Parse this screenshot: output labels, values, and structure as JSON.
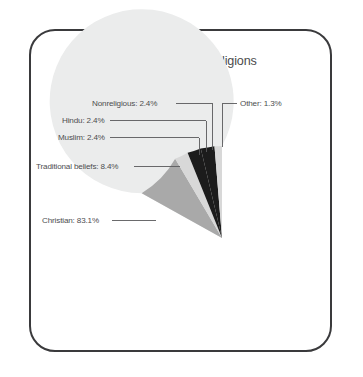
{
  "figure": {
    "title": "South Africa: major religions",
    "frame_color": "#3a3a3c",
    "background": "#ffffff",
    "label_color": "#4d4d4f"
  },
  "chart_data": {
    "type": "pie",
    "title": "South Africa: major religions",
    "xlabel": "",
    "ylabel": "",
    "legend_position": "none",
    "grid": false,
    "labels_on_slices": false,
    "start_angle_deg": 90,
    "direction": "counterclockwise",
    "categories": [
      "Christian",
      "Traditional beliefs",
      "Muslim",
      "Hindu",
      "Nonreligious",
      "Other"
    ],
    "values": [
      83.1,
      8.4,
      2.4,
      2.4,
      2.4,
      1.3
    ],
    "unit": "%",
    "colors": [
      "#ebecec",
      "#a9a9a9",
      "#d8d8d8",
      "#1c1c1c",
      "#1c1c1c",
      "#d8d8d8"
    ],
    "slices": [
      {
        "label": "Christian",
        "value": 83.1,
        "text": "Christian: 83.1%",
        "color": "#ebecec"
      },
      {
        "label": "Traditional beliefs",
        "value": 8.4,
        "text": "Traditional beliefs: 8.4%",
        "color": "#a9a9a9"
      },
      {
        "label": "Muslim",
        "value": 2.4,
        "text": "Muslim: 2.4%",
        "color": "#d8d8d8"
      },
      {
        "label": "Hindu",
        "value": 2.4,
        "text": "Hindu: 2.4%",
        "color": "#1c1c1c"
      },
      {
        "label": "Nonreligious",
        "value": 2.4,
        "text": "Nonreligious: 2.4%",
        "color": "#1c1c1c"
      },
      {
        "label": "Other",
        "value": 1.3,
        "text": "Other: 1.3%",
        "color": "#d8d8d8"
      }
    ]
  }
}
